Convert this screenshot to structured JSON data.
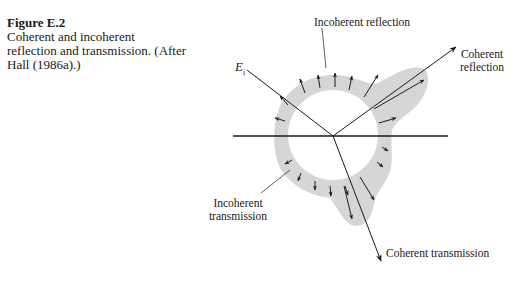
{
  "caption": {
    "figure_label": "Figure E.2",
    "text": "Coherent and incoherent reflection and transmission. (After Hall (1986a).)"
  },
  "diagram": {
    "incident_label": "E",
    "incident_subscript": "i",
    "labels": {
      "incoherent_reflection": "Incoherent reflection",
      "coherent_reflection_line1": "Coherent",
      "coherent_reflection_line2": "reflection",
      "incoherent_transmission_line1": "Incoherent",
      "incoherent_transmission_line2": "transmission",
      "coherent_transmission": "Coherent transmission"
    },
    "colors": {
      "ink": "#1a1a1a",
      "shading": "#d4d4d4"
    }
  }
}
